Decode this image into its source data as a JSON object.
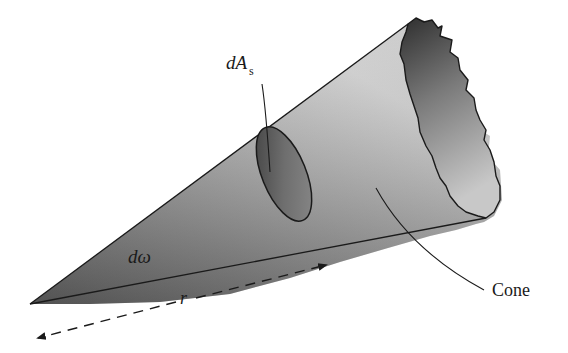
{
  "diagram": {
    "type": "cone-solid-angle",
    "labels": {
      "area": "dA",
      "area_sub": "s",
      "solid_angle": "dω",
      "radius": "r",
      "cone": "Cone"
    },
    "colors": {
      "outline": "#1a1a1a",
      "fill_light": "#d8d8d8",
      "fill_dark": "#5a5a5a",
      "background": "#ffffff"
    }
  }
}
